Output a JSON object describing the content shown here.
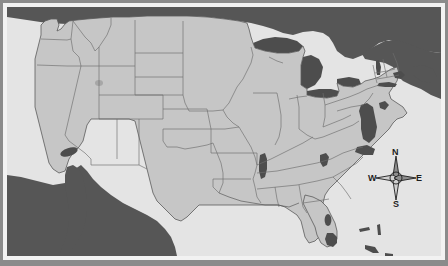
{
  "map": {
    "title": "Contiguous United States map",
    "projection": "Albers-style grayscale reference map",
    "colors": {
      "land_us": "#c6c6c6",
      "land_foreign": "#565656",
      "water_ocean": "#e4e4e4",
      "water_inland": "#4d4d4d",
      "state_border": "#6e6e6e",
      "coast_border": "#5a5a5a",
      "frame_white": "#f2f2f2",
      "mat_gray": "#8b8b8b",
      "text": "#1d1d1d"
    },
    "regions": {
      "united_states": "United States",
      "canada": "Canada",
      "mexico": "Mexico",
      "atlantic_ocean": "Atlantic Ocean",
      "pacific_ocean": "Pacific Ocean",
      "gulf_of_mexico": "Gulf of Mexico",
      "bahamas": "Bahamas"
    },
    "water_features": [
      "Lake Superior",
      "Lake Michigan",
      "Lake Huron",
      "Lake Erie",
      "Lake Ontario",
      "Chesapeake Bay",
      "Delaware Bay",
      "Salton Sea",
      "Lake Okeechobee",
      "Kentucky Lake",
      "Lake Champlain",
      "Long Island Sound"
    ],
    "state_count": 48
  },
  "compass": {
    "name": "compass-rose",
    "north": "N",
    "east": "E",
    "south": "S",
    "west": "W"
  }
}
